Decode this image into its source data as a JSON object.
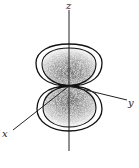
{
  "diagram": {
    "axes": {
      "z": {
        "label": "z"
      },
      "y": {
        "label": "y"
      },
      "x": {
        "label": "x"
      }
    },
    "lobes": [
      {
        "name": "upper-lobe",
        "position": "positive z"
      },
      {
        "name": "lower-lobe",
        "position": "negative z"
      }
    ],
    "colors": {
      "line": "#111111",
      "density_dark": "#6b6b6b",
      "density_light": "#d0d0d0",
      "background": "#ffffff"
    },
    "caption": ""
  }
}
